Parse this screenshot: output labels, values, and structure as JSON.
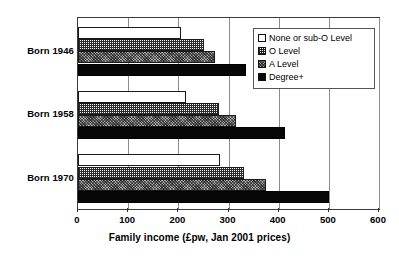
{
  "chart_data": {
    "type": "bar",
    "orientation": "horizontal",
    "title": "",
    "xlabel": "Family income (£pw, Jan 2001 prices)",
    "ylabel": "",
    "xlim": [
      0,
      600
    ],
    "xticks": [
      0,
      100,
      200,
      300,
      400,
      500,
      600
    ],
    "xtick_labels": [
      "0",
      "100",
      "200",
      "300",
      "400",
      "500",
      "600"
    ],
    "grid": true,
    "grid_axis": "x",
    "legend_position": "top-right",
    "categories": [
      "Born 1946",
      "Born 1958",
      "Born 1970"
    ],
    "series": [
      {
        "name": "None or sub-O Level",
        "values": [
          205,
          216,
          283
        ]
      },
      {
        "name": "O Level",
        "values": [
          252,
          281,
          331
        ]
      },
      {
        "name": "A Level",
        "values": [
          274,
          315,
          374
        ]
      },
      {
        "name": "Degree+",
        "values": [
          334,
          413,
          500
        ]
      }
    ]
  },
  "axis": {
    "x_title": "Family income (£pw, Jan 2001 prices)",
    "ticks": [
      "0",
      "100",
      "200",
      "300",
      "400",
      "500",
      "600"
    ]
  },
  "categories": [
    {
      "label": "Born 1946"
    },
    {
      "label": "Born 1958"
    },
    {
      "label": "Born 1970"
    }
  ],
  "legend": {
    "items": [
      {
        "label": "None or sub-O Level",
        "swatch": "white-square-icon"
      },
      {
        "label": "O Level",
        "swatch": "grid-hatch-square-icon"
      },
      {
        "label": "A Level",
        "swatch": "checker-square-icon"
      },
      {
        "label": "Degree+",
        "swatch": "black-square-icon"
      }
    ]
  },
  "colors": {
    "series_none": "#ffffff",
    "series_o_level": "#ffffff",
    "series_a_level": "#a9a9a9",
    "series_degree": "#070707",
    "axis": "#3a3a3a",
    "gridline": "#8d8d8d",
    "text": "#000000"
  }
}
